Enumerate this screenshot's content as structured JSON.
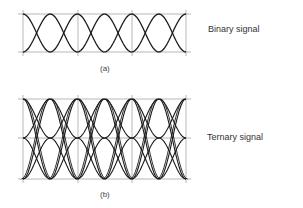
{
  "figure": {
    "panel_a": {
      "label": "Binary signal",
      "caption": "(a)",
      "levels": 2,
      "grid": {
        "left": 23,
        "right": 186,
        "top": 14,
        "bottom": 52,
        "verticals": [
          23,
          78,
          132,
          186
        ]
      }
    },
    "panel_b": {
      "label": "Ternary signal",
      "caption": "(b)",
      "levels": 3,
      "grid": {
        "left": 23,
        "right": 186,
        "top": 99,
        "mid": 138,
        "bottom": 179,
        "verticals": [
          23,
          78,
          132,
          186
        ]
      }
    },
    "colors": {
      "trace": "#1a1a1a",
      "grid": "#9a9a9a"
    }
  }
}
